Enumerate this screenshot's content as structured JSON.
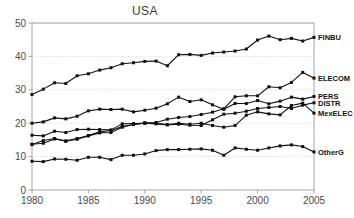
{
  "chart_data": {
    "type": "line",
    "title": "USA",
    "xlabel": "",
    "ylabel": "",
    "xlim": [
      1980,
      2005
    ],
    "ylim": [
      0,
      50
    ],
    "yticks": [
      0,
      10,
      20,
      30,
      40,
      50
    ],
    "xticks": [
      1980,
      1985,
      1990,
      1995,
      2000,
      2005
    ],
    "grid": true,
    "legend_position": "right-inline",
    "x": [
      1980,
      1981,
      1982,
      1983,
      1984,
      1985,
      1986,
      1987,
      1988,
      1989,
      1990,
      1991,
      1992,
      1993,
      1994,
      1995,
      1996,
      1997,
      1998,
      1999,
      2000,
      2001,
      2002,
      2003,
      2004,
      2005
    ],
    "series": [
      {
        "name": "FINBU",
        "label": "FINBU",
        "values": [
          28.6,
          30.2,
          32.1,
          31.9,
          34.2,
          34.8,
          35.9,
          36.6,
          37.8,
          38.1,
          38.5,
          38.6,
          37.2,
          40.5,
          40.6,
          40.3,
          41.0,
          41.3,
          41.6,
          42.2,
          44.9,
          46.1,
          45.0,
          45.4,
          44.6,
          45.7
        ]
      },
      {
        "name": "ELECOM",
        "label": "ELECOM",
        "values": [
          13.7,
          14.0,
          15.3,
          14.7,
          15.4,
          16.3,
          17.4,
          17.8,
          19.0,
          19.6,
          20.1,
          20.0,
          19.6,
          20.0,
          19.7,
          20.0,
          19.3,
          18.8,
          19.3,
          22.4,
          23.4,
          22.8,
          22.5,
          25.3,
          26.0,
          23.0
        ]
      },
      {
        "name": "PERS",
        "label": "PERS",
        "values": [
          20.0,
          20.4,
          21.6,
          21.3,
          22.1,
          23.7,
          24.2,
          24.1,
          24.2,
          23.4,
          23.9,
          24.5,
          25.8,
          27.8,
          26.5,
          27.0,
          25.5,
          24.2,
          25.9,
          25.9,
          26.8,
          25.8,
          26.6,
          27.8,
          27.2,
          28.0
        ]
      },
      {
        "name": "DISTR",
        "label": "DISTR",
        "values": [
          16.4,
          16.2,
          17.6,
          17.2,
          18.1,
          18.2,
          18.1,
          18.0,
          19.8,
          19.9,
          20.0,
          19.8,
          19.5,
          19.7,
          19.4,
          19.3,
          21.0,
          22.7,
          23.0,
          23.6,
          24.4,
          24.7,
          25.0,
          24.4,
          25.4,
          26.1
        ]
      },
      {
        "name": "MexELEC",
        "label": "MexELEC",
        "values": [
          13.6,
          14.8,
          15.4,
          14.6,
          15.2,
          16.2,
          17.1,
          17.2,
          18.8,
          19.6,
          20.0,
          20.2,
          21.2,
          21.7,
          22.0,
          22.6,
          23.3,
          24.3,
          27.9,
          28.2,
          28.2,
          30.9,
          30.6,
          32.2,
          35.2,
          33.5
        ]
      },
      {
        "name": "OtherG",
        "label": "OtherG",
        "values": [
          8.6,
          8.5,
          9.3,
          9.2,
          8.9,
          9.8,
          9.8,
          9.1,
          10.4,
          10.4,
          10.8,
          11.8,
          12.1,
          12.1,
          12.2,
          12.3,
          11.9,
          10.4,
          12.6,
          12.2,
          11.9,
          12.6,
          13.2,
          13.5,
          13.0,
          11.4
        ]
      }
    ],
    "legend_entries": [
      {
        "label": "FINBU",
        "y_value": 45.7
      },
      {
        "label": "ELECOM",
        "y_value": 33.5
      },
      {
        "label": "PERS",
        "y_value": 28.0
      },
      {
        "label": "DISTR",
        "y_value": 26.1
      },
      {
        "label": "MexELEC",
        "y_value": 23.0
      },
      {
        "label": "OtherG",
        "y_value": 11.4
      }
    ]
  },
  "colors": {
    "line": "#111111",
    "grid": "#b8b8b8",
    "frame": "#9a9a9a",
    "tick_text": "#4a4a4a",
    "title_text": "#3a3a3a",
    "background": "#ffffff"
  }
}
